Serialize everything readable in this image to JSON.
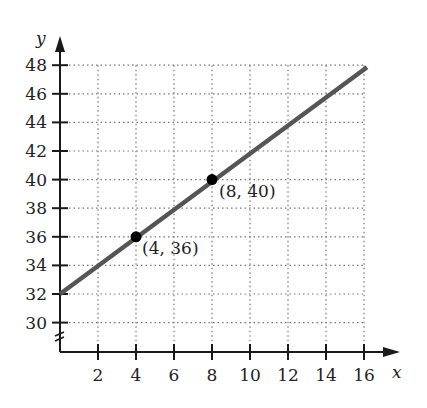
{
  "chart_data": {
    "type": "line",
    "title": "",
    "xlabel": "x",
    "ylabel": "y",
    "xlim": [
      0,
      16
    ],
    "ylim": [
      30,
      48
    ],
    "y_axis_break": true,
    "grid": true,
    "grid_style": "dotted",
    "x_ticks": [
      2,
      4,
      6,
      8,
      10,
      12,
      14,
      16
    ],
    "y_ticks": [
      30,
      32,
      34,
      36,
      38,
      40,
      42,
      44,
      46,
      48
    ],
    "series": [
      {
        "name": "line",
        "x": [
          0,
          16
        ],
        "y": [
          32,
          48
        ],
        "color": "#555555"
      }
    ],
    "points": [
      {
        "x": 4,
        "y": 36,
        "label": "(4, 36)"
      },
      {
        "x": 8,
        "y": 40,
        "label": "(8, 40)"
      }
    ]
  },
  "labels": {
    "x_axis": "x",
    "y_axis": "y",
    "point_a": "(4, 36)",
    "point_b": "(8, 40)",
    "x_ticks": [
      "2",
      "4",
      "6",
      "8",
      "10",
      "12",
      "14",
      "16"
    ],
    "y_ticks": [
      "30",
      "32",
      "34",
      "36",
      "38",
      "40",
      "42",
      "44",
      "46",
      "48"
    ]
  },
  "colors": {
    "line": "#555555",
    "axis": "#1a1a1a",
    "grid": "#777777",
    "point": "#000000"
  }
}
